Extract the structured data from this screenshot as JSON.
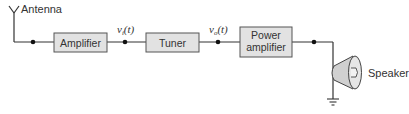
{
  "diagram": {
    "antenna_label": "Antenna",
    "blocks": [
      {
        "id": "amplifier",
        "label_lines": [
          "Amplifier"
        ]
      },
      {
        "id": "tuner",
        "label_lines": [
          "Tuner"
        ]
      },
      {
        "id": "power-amplifier",
        "label_lines": [
          "Power",
          "amplifier"
        ]
      }
    ],
    "signals": [
      {
        "base": "v",
        "sub": "i",
        "arg": "(t)"
      },
      {
        "base": "v",
        "sub": "o",
        "arg": "(t)"
      }
    ],
    "speaker_label": "Speaker",
    "colors": {
      "line": "#333333",
      "block_fill": "#e2e2e2",
      "block_stroke": "#555555",
      "speaker_fill": "#d8d8d8"
    }
  }
}
